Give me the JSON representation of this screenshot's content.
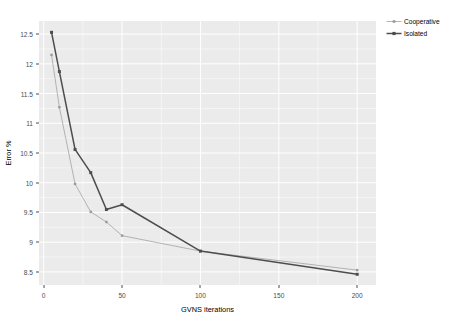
{
  "chart_data": {
    "type": "line",
    "title": "",
    "xlabel": "GVNS iterations",
    "ylabel": "Error %",
    "xlim": [
      -3,
      212
    ],
    "ylim": [
      8.28,
      12.72
    ],
    "xticks": [
      0,
      50,
      100,
      150,
      200
    ],
    "xticklabels": [
      "0",
      "50",
      "100",
      "150",
      "200"
    ],
    "yticks": [
      8.5,
      9,
      9.5,
      10,
      10.5,
      11,
      11.5,
      12,
      12.5
    ],
    "yticklabels": [
      "8.5",
      "9",
      "9.5",
      "10",
      "10.5",
      "11",
      "11.5",
      "12",
      "12.5"
    ],
    "grid": true,
    "grid_color": "#ffffff",
    "panel_background": "#ebebeb",
    "legend_position": "right",
    "x": [
      5,
      10,
      20,
      30,
      40,
      50,
      100,
      200
    ],
    "series": [
      {
        "name": "Cooperative",
        "color": "#999999",
        "line_width": 0.7,
        "marker": "square",
        "values": [
          12.15,
          11.27,
          9.98,
          9.51,
          9.34,
          9.11,
          8.85,
          8.53
        ]
      },
      {
        "name": "Isolated",
        "color": "#4d4d4d",
        "line_width": 1.5,
        "marker": "square",
        "values": [
          12.53,
          11.87,
          10.56,
          10.17,
          9.55,
          9.63,
          8.85,
          8.46
        ]
      }
    ]
  },
  "legend": {
    "entries": [
      {
        "label": "Cooperative"
      },
      {
        "label": "Isolated"
      }
    ]
  }
}
